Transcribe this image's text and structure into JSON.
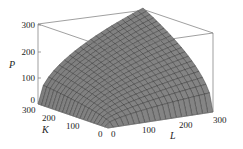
{
  "chart_data": {
    "type": "surface3d",
    "title": "",
    "function": "P = f(L, K), Cobb-Douglas-like production surface",
    "axes": {
      "x": {
        "label": "L",
        "range": [
          0,
          300
        ],
        "ticks": [
          "0",
          "100",
          "200",
          "300"
        ]
      },
      "y": {
        "label": "K",
        "range": [
          0,
          300
        ],
        "ticks": [
          "0",
          "100",
          "200",
          "300"
        ]
      },
      "z": {
        "label": "P",
        "range": [
          0,
          300
        ],
        "ticks": [
          "0",
          "100",
          "200",
          "300"
        ]
      }
    },
    "surface": {
      "shape": "concave increasing in both L and K, P=0 along L=0 and K=0, P≈300 at L=K=300",
      "sample_points": [
        {
          "L": 0,
          "K": 0,
          "P": 0
        },
        {
          "L": 300,
          "K": 0,
          "P": 0
        },
        {
          "L": 0,
          "K": 300,
          "P": 0
        },
        {
          "L": 100,
          "K": 100,
          "P": 100
        },
        {
          "L": 200,
          "K": 200,
          "P": 200
        },
        {
          "L": 300,
          "K": 300,
          "P": 300
        }
      ],
      "color": "#8a8a8a",
      "mesh_color": "#222222",
      "grid_lines": 20
    },
    "bounding_box": true,
    "grid": false,
    "legend": null
  },
  "labels": {
    "z_title": "P",
    "y_title": "K",
    "x_title": "L",
    "z_ticks": [
      "300",
      "200",
      "100",
      "0"
    ],
    "k_ticks": [
      "300",
      "200",
      "100",
      "0"
    ],
    "l_ticks": [
      "0",
      "100",
      "200",
      "300"
    ]
  }
}
